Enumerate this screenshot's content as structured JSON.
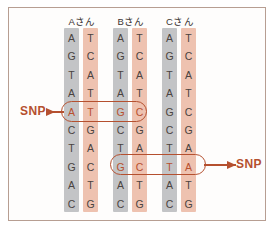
{
  "figure": {
    "background_color": "#ffffff",
    "frame_color": "#b79e92"
  },
  "colors": {
    "strand_gray": "#c3c4c6",
    "strand_salmon": "#eec2b0",
    "base_text": "#4a4340",
    "snp_red": "#b5502f",
    "frame": "#b79e92"
  },
  "persons": [
    {
      "label": "Aさん",
      "name": "person-a"
    },
    {
      "label": "Bさん",
      "name": "person-b"
    },
    {
      "label": "Cさん",
      "name": "person-c"
    }
  ],
  "columns": [
    {
      "person": "Aさん",
      "strand": 1,
      "shade": "gray",
      "bases": [
        "A",
        "G",
        "T",
        "A",
        "A",
        "C",
        "T",
        "G",
        "A",
        "C"
      ]
    },
    {
      "person": "Aさん",
      "strand": 2,
      "shade": "salmon",
      "bases": [
        "T",
        "C",
        "A",
        "T",
        "T",
        "G",
        "A",
        "C",
        "T",
        "G"
      ]
    },
    {
      "person": "Bさん",
      "strand": 1,
      "shade": "gray",
      "bases": [
        "A",
        "G",
        "T",
        "A",
        "G",
        "C",
        "T",
        "G",
        "A",
        "C"
      ]
    },
    {
      "person": "Bさん",
      "strand": 2,
      "shade": "salmon",
      "bases": [
        "T",
        "C",
        "A",
        "T",
        "C",
        "G",
        "A",
        "C",
        "T",
        "G"
      ]
    },
    {
      "person": "Cさん",
      "strand": 1,
      "shade": "gray",
      "bases": [
        "A",
        "G",
        "T",
        "A",
        "G",
        "C",
        "T",
        "T",
        "A",
        "C"
      ]
    },
    {
      "person": "Cさん",
      "strand": 2,
      "shade": "salmon",
      "bases": [
        "T",
        "C",
        "A",
        "T",
        "C",
        "G",
        "A",
        "A",
        "T",
        "G"
      ]
    }
  ],
  "snp_rows": [
    {
      "row_index": 4,
      "columns": [
        0,
        1,
        2,
        3
      ],
      "label": "SNP",
      "label_side": "left"
    },
    {
      "row_index": 7,
      "columns": [
        2,
        3,
        4,
        5
      ],
      "label": "SNP",
      "label_side": "right"
    }
  ],
  "annotations": {
    "snp_left_label": "SNP",
    "snp_right_label": "SNP"
  }
}
